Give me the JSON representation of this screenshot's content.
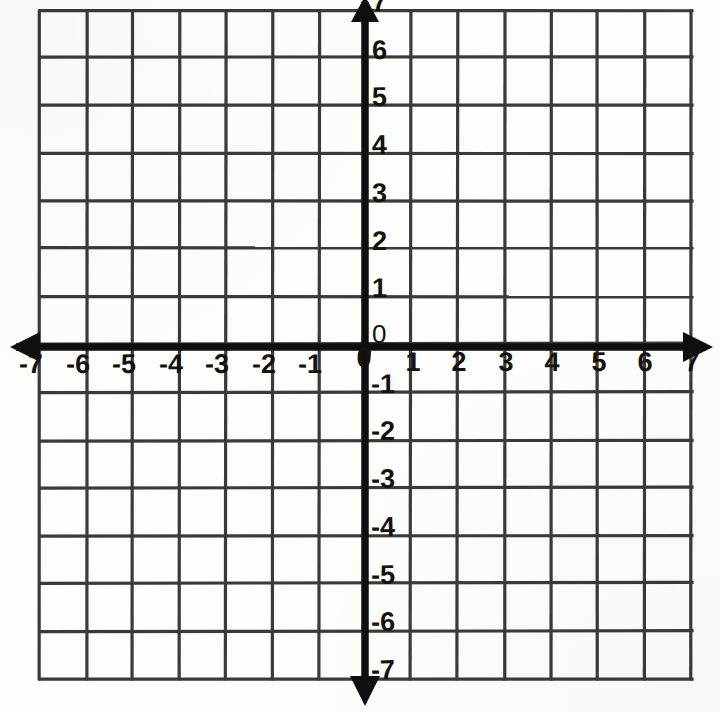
{
  "chart_data": {
    "type": "grid",
    "title": "",
    "xlabel": "",
    "ylabel": "",
    "xlim": [
      -7,
      7
    ],
    "ylim": [
      -7,
      7
    ],
    "x_tick_labels": [
      "-7",
      "-6",
      "-5",
      "-4",
      "-3",
      "-2",
      "-1",
      "0",
      "1",
      "2",
      "3",
      "4",
      "5",
      "6",
      "7"
    ],
    "y_tick_labels": [
      "7",
      "6",
      "5",
      "4",
      "3",
      "2",
      "1",
      "0",
      "-1",
      "-2",
      "-3",
      "-4",
      "-5",
      "-6",
      "-7"
    ],
    "x_ticks": [
      -7,
      -6,
      -5,
      -4,
      -3,
      -2,
      -1,
      0,
      1,
      2,
      3,
      4,
      5,
      6,
      7
    ],
    "y_ticks": [
      7,
      6,
      5,
      4,
      3,
      2,
      1,
      0,
      -1,
      -2,
      -3,
      -4,
      -5,
      -6,
      -7
    ],
    "grid": true,
    "grid_columns": 14,
    "grid_rows": 14,
    "legend": null,
    "series": [],
    "annotations": [],
    "origin_label_x": "0",
    "origin_label_y": "0",
    "axis_arrows": [
      "left",
      "right",
      "up",
      "down"
    ],
    "colors": {
      "background": "#fdfdfc",
      "grid_line": "#3a3a3a",
      "axis_line": "#0f0f0f",
      "label_text": "#14120f"
    }
  },
  "labels": {
    "x_axis": {
      "negatives": [
        {
          "text": "-7",
          "value": -7
        },
        {
          "text": "-6",
          "value": -6
        },
        {
          "text": "-5",
          "value": -5
        },
        {
          "text": "-4",
          "value": -4
        },
        {
          "text": "-3",
          "value": -3
        },
        {
          "text": "-2",
          "value": -2
        },
        {
          "text": "-1",
          "value": -1
        }
      ],
      "origin": {
        "text": "0",
        "value": 0
      },
      "positives": [
        {
          "text": "1",
          "value": 1
        },
        {
          "text": "2",
          "value": 2
        },
        {
          "text": "3",
          "value": 3
        },
        {
          "text": "4",
          "value": 4
        },
        {
          "text": "5",
          "value": 5
        },
        {
          "text": "6",
          "value": 6
        },
        {
          "text": "7",
          "value": 7
        }
      ]
    },
    "y_axis": {
      "positives": [
        {
          "text": "7",
          "value": 7
        },
        {
          "text": "6",
          "value": 6
        },
        {
          "text": "5",
          "value": 5
        },
        {
          "text": "4",
          "value": 4
        },
        {
          "text": "3",
          "value": 3
        },
        {
          "text": "2",
          "value": 2
        },
        {
          "text": "1",
          "value": 1
        }
      ],
      "origin": {
        "text": "0",
        "value": 0
      },
      "negatives": [
        {
          "text": "-1",
          "value": -1
        },
        {
          "text": "-2",
          "value": -2
        },
        {
          "text": "-3",
          "value": -3
        },
        {
          "text": "-4",
          "value": -4
        },
        {
          "text": "-5",
          "value": -5
        },
        {
          "text": "-6",
          "value": -6
        },
        {
          "text": "-7",
          "value": -7
        }
      ]
    }
  }
}
